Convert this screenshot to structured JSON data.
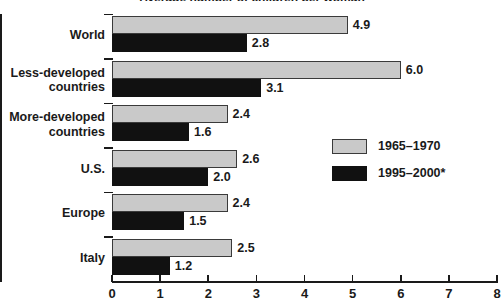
{
  "chart_data": {
    "type": "bar",
    "orientation": "horizontal",
    "title": "Average number of children per woman",
    "title_clipped": true,
    "categories": [
      "World",
      "Less-developed\ncountries",
      "More-developed\ncountries",
      "U.S.",
      "Europe",
      "Italy"
    ],
    "series": [
      {
        "name": "1965–1970",
        "color": "#c9c9c9",
        "values": [
          4.9,
          6.0,
          2.4,
          2.6,
          2.4,
          2.5
        ],
        "labels": [
          "4.9",
          "6.0",
          "2.4",
          "2.6",
          "2.4",
          "2.5"
        ]
      },
      {
        "name": "1995–2000*",
        "color": "#111111",
        "values": [
          2.8,
          3.1,
          1.6,
          2.0,
          1.5,
          1.2
        ],
        "labels": [
          "2.8",
          "3.1",
          "1.6",
          "2.0",
          "1.5",
          "1.2"
        ]
      }
    ],
    "xlabel": "",
    "ylabel": "",
    "xlim": [
      0,
      8
    ],
    "xticks": [
      0,
      1,
      2,
      3,
      4,
      5,
      6,
      7,
      8
    ],
    "xticklabels": [
      "0",
      "1",
      "2",
      "3",
      "4",
      "5",
      "6",
      "7",
      "8"
    ],
    "grid": false,
    "legend_position": "center-right"
  },
  "legend": {
    "items": [
      {
        "label": "1965–1970",
        "swatch": "light"
      },
      {
        "label": "1995–2000*",
        "swatch": "dark"
      }
    ]
  }
}
